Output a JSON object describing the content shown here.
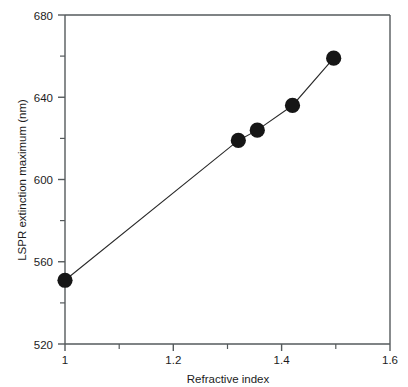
{
  "chart_data": {
    "type": "scatter",
    "title": "",
    "xlabel": "Refractive index",
    "ylabel": "LSPR extinction maximum (nm)",
    "xlim": [
      1.0,
      1.6
    ],
    "ylim": [
      520,
      680
    ],
    "grid": false,
    "legend": null,
    "x_ticks": [
      1,
      1.2,
      1.4,
      1.6
    ],
    "x_tick_labels": [
      "1",
      "1.2",
      "1.4",
      "1.6"
    ],
    "x_minor_ticks": [
      1.1,
      1.3,
      1.5
    ],
    "y_ticks": [
      520,
      560,
      600,
      640,
      680
    ],
    "y_tick_labels": [
      "520",
      "560",
      "600",
      "640",
      "680"
    ],
    "y_minor_ticks": [
      540,
      580,
      620,
      660
    ],
    "series": [
      {
        "name": "LSPR shift",
        "marker": "filled-circle",
        "line": "solid",
        "color": "#161616",
        "x": [
          1.0,
          1.32,
          1.355,
          1.42,
          1.496
        ],
        "y": [
          551,
          619,
          624,
          636,
          659
        ]
      }
    ],
    "points": [
      {
        "x": 1.0,
        "y": 551
      },
      {
        "x": 1.32,
        "y": 619
      },
      {
        "x": 1.355,
        "y": 624
      },
      {
        "x": 1.42,
        "y": 636
      },
      {
        "x": 1.496,
        "y": 659
      }
    ]
  },
  "axes": {
    "x_title": "Refractive index",
    "y_title": "LSPR extinction maximum (nm)"
  },
  "ticks": {
    "x": [
      "1",
      "1.2",
      "1.4",
      "1.6"
    ],
    "y": [
      "520",
      "560",
      "600",
      "640",
      "680"
    ]
  },
  "colors": {
    "marker": "#161616",
    "line": "#2a2a2a",
    "axis": "#555a5c",
    "background": "#ffffff",
    "text": "#1c1c1c"
  }
}
